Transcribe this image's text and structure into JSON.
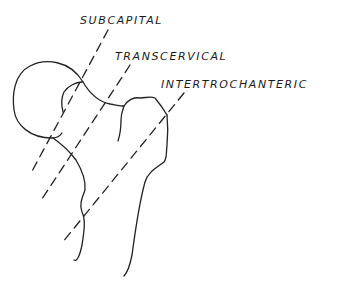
{
  "diagram": {
    "labels": {
      "subcapital": "SUBCAPITAL",
      "transcervical": "TRANSCERVICAL",
      "intertrochanteric": "INTERTROCHANTERIC"
    },
    "colors": {
      "line": "#222222",
      "background": "#ffffff"
    }
  }
}
